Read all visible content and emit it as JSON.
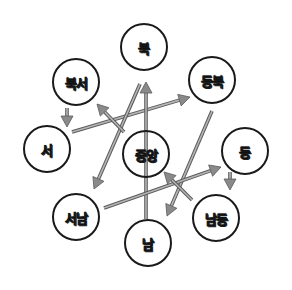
{
  "diagram": {
    "type": "directional-flow",
    "colors": {
      "arrow": "#8a8a8a",
      "arrow_edge": "#5a5a5a",
      "circle": "#1a1a1a",
      "label": "#555555"
    },
    "nodes": [
      {
        "id": "north",
        "label": "북",
        "cx": 144,
        "cy": 47,
        "r": 24
      },
      {
        "id": "northwest",
        "label": "북서",
        "cx": 76,
        "cy": 82,
        "r": 24
      },
      {
        "id": "northeast",
        "label": "동북",
        "cx": 212,
        "cy": 80,
        "r": 24
      },
      {
        "id": "west",
        "label": "서",
        "cx": 47,
        "cy": 149,
        "r": 24
      },
      {
        "id": "center",
        "label": "중앙",
        "cx": 146,
        "cy": 154,
        "r": 24
      },
      {
        "id": "east",
        "label": "동",
        "cx": 245,
        "cy": 151,
        "r": 24
      },
      {
        "id": "southwest",
        "label": "서남",
        "cx": 76,
        "cy": 217,
        "r": 24
      },
      {
        "id": "southeast",
        "label": "남동",
        "cx": 216,
        "cy": 218,
        "r": 24
      },
      {
        "id": "south",
        "label": "남",
        "cx": 148,
        "cy": 243,
        "r": 24
      }
    ],
    "arrows": [
      {
        "from": "northwest",
        "to": "west",
        "x1": 67,
        "y1": 108,
        "x2": 67,
        "y2": 127
      },
      {
        "from": "west",
        "to": "northeast",
        "x1": 72,
        "y1": 132,
        "x2": 190,
        "y2": 97
      },
      {
        "from": "north",
        "to": "southwest",
        "x1": 140,
        "y1": 84,
        "x2": 94,
        "y2": 189
      },
      {
        "from": "south",
        "to": "north",
        "x1": 146,
        "y1": 219,
        "x2": 146,
        "y2": 82
      },
      {
        "from": "northeast",
        "to": "south",
        "x1": 212,
        "y1": 111,
        "x2": 167,
        "y2": 216
      },
      {
        "from": "southwest",
        "to": "east",
        "x1": 104,
        "y1": 208,
        "x2": 221,
        "y2": 167
      },
      {
        "from": "east",
        "to": "southeast",
        "x1": 230,
        "y1": 172,
        "x2": 230,
        "y2": 190
      },
      {
        "from": "southeast",
        "to": "center",
        "x1": 192,
        "y1": 200,
        "x2": 164,
        "y2": 172
      },
      {
        "from": "center",
        "to": "northwest",
        "x1": 124,
        "y1": 132,
        "x2": 97,
        "y2": 104
      }
    ]
  }
}
